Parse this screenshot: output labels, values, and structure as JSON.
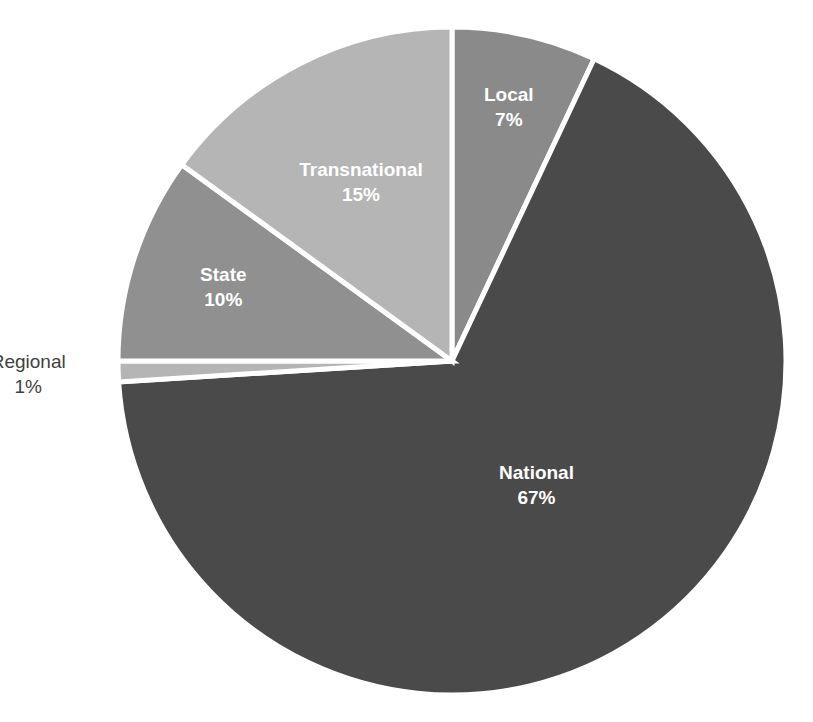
{
  "chart_data": {
    "type": "pie",
    "title": "",
    "subtitle": "",
    "xlabel": "",
    "ylabel": "",
    "legend_position": "none",
    "grid": false,
    "labels_position": "inside-slices",
    "categories": [
      "Local",
      "National",
      "Regional",
      "State",
      "Transnational"
    ],
    "values": [
      7,
      67,
      1,
      10,
      15
    ],
    "value_unit": "%",
    "start_angle_deg": 0,
    "direction": "clockwise",
    "slices": [
      {
        "name": "Local",
        "label": "Local",
        "value": 7,
        "value_text": "7%",
        "color": "#8a8a8a",
        "label_color": "#ffffff",
        "label_placement": "inside"
      },
      {
        "name": "National",
        "label": "National",
        "value": 67,
        "value_text": "67%",
        "color": "#4a4a4a",
        "label_color": "#ffffff",
        "label_placement": "inside"
      },
      {
        "name": "Regional",
        "label": "Regional",
        "value": 1,
        "value_text": "1%",
        "color": "#b5b5b5",
        "label_color": "#3f3f3f",
        "label_placement": "outside"
      },
      {
        "name": "State",
        "label": "State",
        "value": 10,
        "value_text": "10%",
        "color": "#909090",
        "label_color": "#ffffff",
        "label_placement": "inside"
      },
      {
        "name": "Transnational",
        "label": "Transnational",
        "value": 15,
        "value_text": "15%",
        "color": "#b5b5b5",
        "label_color": "#ffffff",
        "label_placement": "inside"
      }
    ],
    "geometry": {
      "center_x": 452,
      "center_y": 361,
      "radius": 334,
      "separator_color": "#ffffff",
      "separator_width": 5,
      "background": "#ffffff"
    }
  }
}
